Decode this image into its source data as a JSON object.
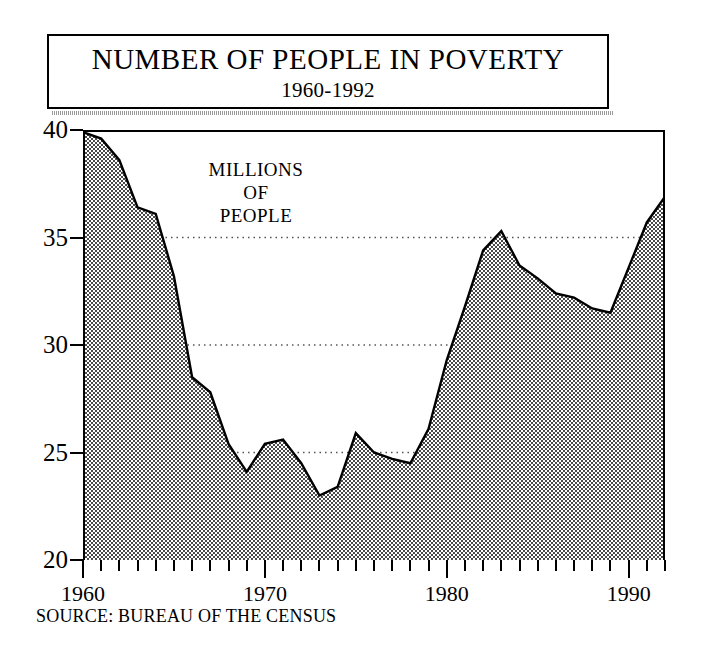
{
  "title": {
    "main": "NUMBER OF PEOPLE IN POVERTY",
    "subtitle": "1960-1992"
  },
  "annotation": {
    "line1": "MILLIONS",
    "line2": "OF",
    "line3": "PEOPLE"
  },
  "source": "SOURCE: BUREAU OF THE CENSUS",
  "colors": {
    "axis": "#000000",
    "fill": "#8c8c8c",
    "line": "#000000",
    "gridline": "#555555",
    "background": "#ffffff"
  },
  "chart_data": {
    "type": "area",
    "title": "NUMBER OF PEOPLE IN POVERTY",
    "subtitle": "1960-1992",
    "xlabel": "",
    "ylabel": "MILLIONS OF PEOPLE",
    "xlim": [
      1960,
      1992
    ],
    "ylim": [
      20,
      40
    ],
    "yticks": [
      20,
      25,
      30,
      35,
      40
    ],
    "ytick_labels": [
      "20",
      "25",
      "30",
      "35",
      "40"
    ],
    "xticks": [
      1960,
      1970,
      1980,
      1990
    ],
    "xtick_labels": [
      "1960",
      "1970",
      "1980",
      "1990"
    ],
    "xtick_minor_interval": 1,
    "grid": "horizontal-dotted",
    "legend": "none",
    "series": [
      {
        "name": "People in poverty (millions)",
        "x": [
          1960,
          1961,
          1962,
          1963,
          1964,
          1965,
          1966,
          1967,
          1968,
          1969,
          1970,
          1971,
          1972,
          1973,
          1974,
          1975,
          1976,
          1977,
          1978,
          1979,
          1980,
          1981,
          1982,
          1983,
          1984,
          1985,
          1986,
          1987,
          1988,
          1989,
          1990,
          1991,
          1992
        ],
        "values": [
          39.9,
          39.6,
          38.6,
          36.4,
          36.1,
          33.2,
          28.5,
          27.8,
          25.4,
          24.1,
          25.4,
          25.6,
          24.5,
          23.0,
          23.4,
          25.9,
          25.0,
          24.7,
          24.5,
          26.1,
          29.3,
          31.8,
          34.4,
          35.3,
          33.7,
          33.1,
          32.4,
          32.2,
          31.7,
          31.5,
          33.6,
          35.7,
          36.9
        ]
      }
    ]
  }
}
